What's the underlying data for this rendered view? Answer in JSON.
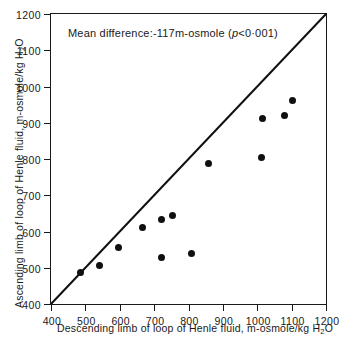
{
  "chart_data": {
    "type": "scatter",
    "title": "",
    "annotation": "Mean difference:-117m-osmole (p<0·001)",
    "annotation_parts": {
      "prefix": "Mean difference:-117m-osmole (",
      "italic": "p",
      "suffix": "<0·001)"
    },
    "xlabel": "Descending limb of loop of Henle fluid,  m-osmole/kg H2O",
    "xlabel_parts": {
      "main": "Descending limb of loop of Henle fluid,  m-osmole/kg H",
      "sub": "2",
      "tail": "O"
    },
    "ylabel": "Ascending limb of loop of Henle fluid,  m-osmole/kg H2O",
    "ylabel_parts": {
      "main": "Ascending limb of loop of Henle fluid,  m-osmole/kg  H",
      "sub": "2",
      "tail": "O"
    },
    "xlim": [
      400,
      1200
    ],
    "ylim": [
      400,
      1200
    ],
    "xticks": [
      400,
      500,
      600,
      700,
      800,
      900,
      1000,
      1100,
      1200
    ],
    "yticks": [
      400,
      500,
      600,
      700,
      800,
      900,
      1000,
      1100,
      1200
    ],
    "xticklabels": [
      "400",
      "500",
      "600",
      "700",
      "800",
      "900",
      "1000",
      "1100",
      "1200"
    ],
    "yticklabels": [
      "400",
      "500",
      "600",
      "700",
      "800",
      "900",
      "1000",
      "1100",
      "1200"
    ],
    "grid": false,
    "legend": false,
    "reference_line": {
      "name": "line-of-identity",
      "type": "identity",
      "from": [
        400,
        400
      ],
      "to": [
        1200,
        1200
      ],
      "color": "#101010"
    },
    "points": [
      {
        "x": 487,
        "y": 488
      },
      {
        "x": 542,
        "y": 506
      },
      {
        "x": 595,
        "y": 557
      },
      {
        "x": 665,
        "y": 610
      },
      {
        "x": 720,
        "y": 634
      },
      {
        "x": 752,
        "y": 644
      },
      {
        "x": 722,
        "y": 528
      },
      {
        "x": 810,
        "y": 540
      },
      {
        "x": 858,
        "y": 787
      },
      {
        "x": 1013,
        "y": 803
      },
      {
        "x": 1015,
        "y": 913
      },
      {
        "x": 1078,
        "y": 921
      },
      {
        "x": 1103,
        "y": 961
      }
    ],
    "series": [
      {
        "name": "Henle loop fluid osmolality pairs",
        "marker": "filled-circle",
        "color": "#101010",
        "x": [
          487,
          542,
          595,
          665,
          720,
          752,
          722,
          810,
          858,
          1013,
          1015,
          1078,
          1103
        ],
        "y": [
          488,
          506,
          557,
          610,
          634,
          644,
          528,
          540,
          787,
          803,
          913,
          921,
          961
        ]
      }
    ]
  }
}
